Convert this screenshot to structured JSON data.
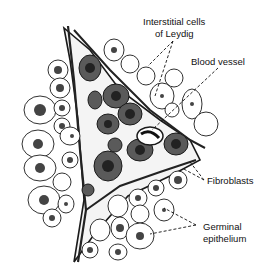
{
  "figure": {
    "labels": [
      {
        "id": "leydig",
        "lines": [
          "Interstitial cells",
          "of Leydig"
        ]
      },
      {
        "id": "blood-vessel",
        "lines": [
          "Blood vessel"
        ]
      },
      {
        "id": "fibroblasts",
        "lines": [
          "Fibroblasts"
        ]
      },
      {
        "id": "germinal-epithelium",
        "lines": [
          "Germinal",
          "epithelium"
        ]
      }
    ]
  },
  "colors": {
    "ink": "#1a1a1a",
    "dark_cell": "#4a4a4a",
    "nucleus": "#2a2a2a",
    "background": "#ffffff"
  }
}
